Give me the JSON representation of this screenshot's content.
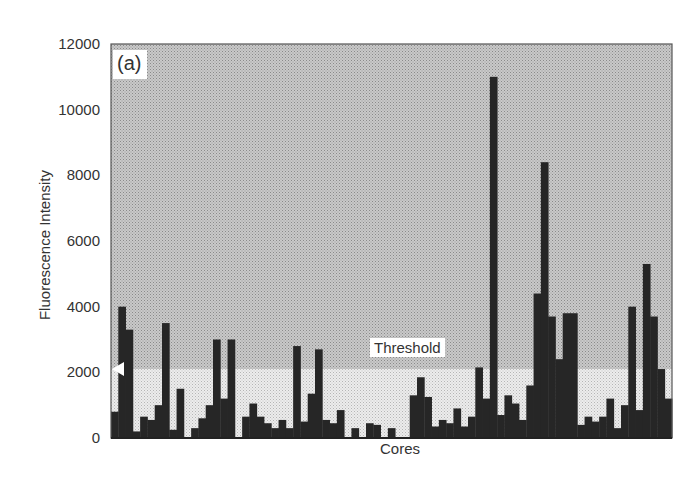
{
  "chart_data": {
    "type": "bar",
    "title": "",
    "panel_label": "(a)",
    "xlabel": "Cores",
    "ylabel": "Fluorescence Intensity",
    "ylim": [
      0,
      12000
    ],
    "yticks": [
      0,
      2000,
      4000,
      6000,
      8000,
      10000,
      12000
    ],
    "ytick_labels": [
      "0",
      "2000",
      "4000",
      "6000",
      "8000",
      "10000",
      "12000"
    ],
    "grid": false,
    "legend": null,
    "threshold": {
      "value": 2100,
      "label": "Threshold"
    },
    "colors": {
      "bar": "#262626",
      "above_threshold_bg": "#b8b8b8",
      "below_threshold_bg": "#e2e2e2",
      "axis": "#333333"
    },
    "categories_note": "Individual cores (unlabeled)",
    "values": [
      800,
      4000,
      3300,
      200,
      650,
      550,
      1000,
      3500,
      250,
      1500,
      0,
      300,
      600,
      1000,
      3000,
      1200,
      3000,
      0,
      650,
      1050,
      650,
      450,
      300,
      550,
      300,
      2800,
      500,
      1350,
      2700,
      550,
      450,
      850,
      0,
      300,
      0,
      450,
      400,
      0,
      300,
      0,
      0,
      1300,
      1850,
      1250,
      350,
      550,
      450,
      900,
      350,
      650,
      2150,
      1200,
      11000,
      700,
      1300,
      1050,
      550,
      1600,
      4400,
      8400,
      3700,
      2400,
      3800,
      3800,
      400,
      650,
      500,
      650,
      1200,
      300,
      1000,
      4000,
      850,
      5300,
      3700,
      2100,
      1200
    ]
  }
}
